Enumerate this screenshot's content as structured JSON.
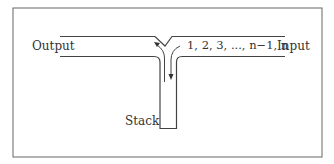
{
  "diagram": {
    "labels": {
      "output": "Output",
      "input": "Input",
      "sequence": "1, 2, 3, ..., n−1, n",
      "stack": "Stack"
    },
    "colors": {
      "stroke": "#444444",
      "text": "#333333",
      "background": "#ffffff"
    }
  }
}
